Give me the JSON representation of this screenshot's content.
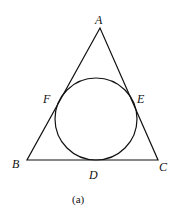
{
  "diagram": {
    "type": "triangle-with-incircle",
    "stroke_color": "#111111",
    "background": "#ffffff",
    "vertices": [
      {
        "name": "A",
        "x": 100,
        "y": 28
      },
      {
        "name": "B",
        "x": 27,
        "y": 160
      },
      {
        "name": "C",
        "x": 158,
        "y": 160
      }
    ],
    "incircle": {
      "cx": 96,
      "cy": 119,
      "r": 41
    },
    "tangent_points": [
      {
        "name": "D",
        "on_side": "BC"
      },
      {
        "name": "E",
        "on_side": "CA"
      },
      {
        "name": "F",
        "on_side": "AB"
      }
    ],
    "labels": {
      "A": "A",
      "B": "B",
      "C": "C",
      "D": "D",
      "E": "E",
      "F": "F"
    },
    "caption": "(a)"
  }
}
